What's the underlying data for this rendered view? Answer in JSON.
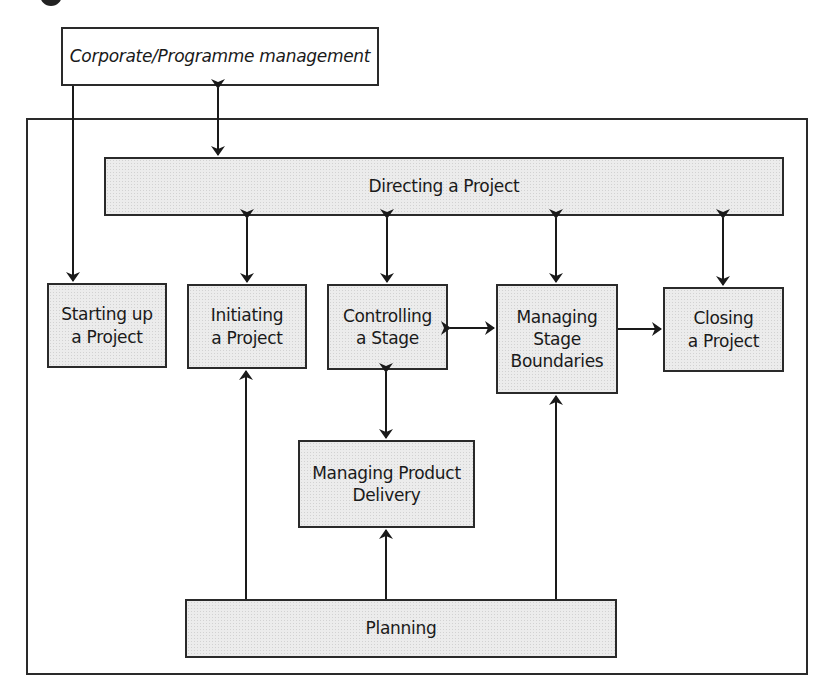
{
  "diagram": {
    "external": {
      "corporate": "Corporate/Programme management"
    },
    "processes": {
      "directing": "Directing a Project",
      "starting": "Starting up\na Project",
      "initiating": "Initiating\na Project",
      "controlling": "Controlling\na Stage",
      "managing_stage_boundaries": "Managing\nStage\nBoundaries",
      "closing": "Closing\na Project",
      "managing_product_delivery": "Managing Product\nDelivery",
      "planning": "Planning"
    },
    "connections": [
      {
        "from": "Corporate/Programme management",
        "to": "Directing a Project",
        "type": "bidirectional"
      },
      {
        "from": "Corporate/Programme management",
        "to": "Starting up a Project",
        "type": "directed"
      },
      {
        "from": "Directing a Project",
        "to": "Initiating a Project",
        "type": "bidirectional"
      },
      {
        "from": "Directing a Project",
        "to": "Controlling a Stage",
        "type": "bidirectional"
      },
      {
        "from": "Directing a Project",
        "to": "Managing Stage Boundaries",
        "type": "bidirectional"
      },
      {
        "from": "Directing a Project",
        "to": "Closing a Project",
        "type": "bidirectional"
      },
      {
        "from": "Controlling a Stage",
        "to": "Managing Stage Boundaries",
        "type": "bidirectional"
      },
      {
        "from": "Managing Stage Boundaries",
        "to": "Closing a Project",
        "type": "directed"
      },
      {
        "from": "Controlling a Stage",
        "to": "Managing Product Delivery",
        "type": "bidirectional"
      },
      {
        "from": "Planning",
        "to": "Initiating a Project",
        "type": "directed"
      },
      {
        "from": "Planning",
        "to": "Managing Product Delivery",
        "type": "directed"
      },
      {
        "from": "Planning",
        "to": "Managing Stage Boundaries",
        "type": "directed"
      }
    ],
    "colors": {
      "stroke": "#2a2a2a",
      "process_fill": "#ececec",
      "external_fill": "#ffffff"
    }
  }
}
